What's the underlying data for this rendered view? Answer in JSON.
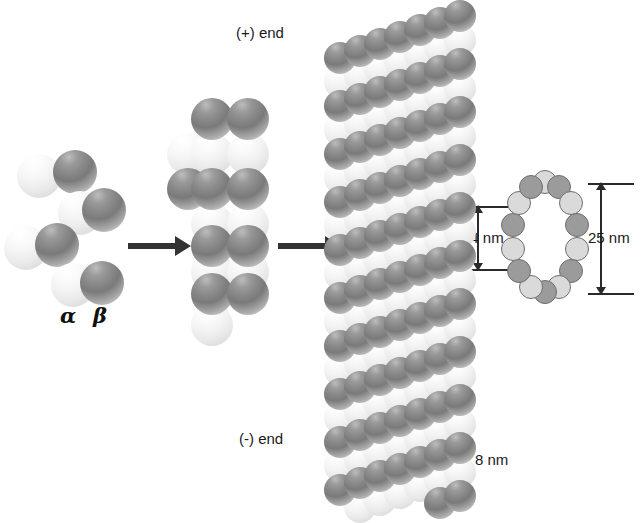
{
  "figure": {
    "labels": {
      "plus_end": "(+) end",
      "minus_end": "(-) end",
      "alpha": "α",
      "beta": "β",
      "diameter_inner": "14 nm",
      "diameter_outer": "25 nm",
      "subunit_repeat": "8 nm"
    }
  },
  "stage1_dimers": {
    "name": "free tubulin alpha-beta dimers",
    "monomer_radius": 22,
    "items": [
      {
        "alpha": {
          "cx": 39,
          "cy": 176
        },
        "beta": {
          "cx": 75,
          "cy": 172
        }
      },
      {
        "alpha": {
          "cx": 80,
          "cy": 213
        },
        "beta": {
          "cx": 104,
          "cy": 210
        }
      },
      {
        "alpha": {
          "cx": 26,
          "cy": 248
        },
        "beta": {
          "cx": 57,
          "cy": 245
        }
      },
      {
        "alpha": {
          "cx": 73,
          "cy": 285
        },
        "beta": {
          "cx": 102,
          "cy": 283
        }
      }
    ]
  },
  "stage2_protofilament": {
    "name": "growing protofilament",
    "monomer_radius": 21,
    "rows": [
      {
        "y": 119,
        "shade": "dark",
        "xs": [
          212,
          248
        ]
      },
      {
        "y": 154,
        "shade": "light",
        "xs": [
          188,
          212,
          248
        ]
      },
      {
        "y": 189,
        "shade": "dark",
        "xs": [
          188,
          212,
          248
        ]
      },
      {
        "y": 224,
        "shade": "light",
        "xs": [
          212,
          248
        ]
      },
      {
        "y": 246,
        "shade": "dark",
        "xs": [
          212,
          248
        ]
      },
      {
        "y": 272,
        "shade": "light",
        "xs": [
          212,
          248
        ]
      },
      {
        "y": 294,
        "shade": "dark",
        "xs": [
          212,
          248
        ]
      },
      {
        "y": 325,
        "shade": "light",
        "xs": [
          212
        ]
      }
    ]
  },
  "stage3_microtubule": {
    "name": "assembled microtubule cylinder",
    "left": 332,
    "right": 452,
    "top": 2,
    "bottom": 492,
    "columns": 6,
    "row_pitch": 24,
    "row_count": 21,
    "diagonal_rise_per_column": 7,
    "monomer_radius": 16,
    "alternating": [
      "dark",
      "light"
    ]
  },
  "cross_section": {
    "name": "microtubule cross-section ring",
    "center": {
      "x": 545,
      "y": 237
    },
    "radius_x": 33,
    "radius_y": 55,
    "subunit_radius": 12,
    "subunit_count": 14,
    "shades": [
      "light",
      "dark",
      "light",
      "dark",
      "light",
      "dark",
      "light",
      "dark",
      "light",
      "dark",
      "light",
      "dark",
      "light",
      "dark"
    ],
    "dimensions": [
      {
        "label": "14 nm",
        "orientation": "vertical",
        "side": "left"
      },
      {
        "label": "25 nm",
        "orientation": "vertical",
        "side": "right"
      }
    ]
  },
  "arrows": [
    {
      "name": "arrow-dimer-to-protofilament",
      "x": 128,
      "y": 243,
      "width": 48
    },
    {
      "name": "arrow-protofilament-to-microtubule",
      "x": 278,
      "y": 243,
      "width": 48
    }
  ],
  "colors": {
    "alpha_subunit": "#e9e9e9",
    "beta_subunit": "#8a8a8a",
    "ring_light": "#dadada",
    "ring_dark": "#9b9b9b",
    "arrow": "#333333",
    "text": "#1a1a1a",
    "background": "#ffffff"
  }
}
